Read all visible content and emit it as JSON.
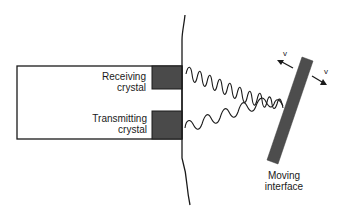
{
  "diagram": {
    "colors": {
      "background": "#ffffff",
      "line": "#1a1a1a",
      "crystal_fill": "#4a4a4a",
      "interface_fill": "#4d4d4d"
    },
    "probe": {
      "receiving_crystal": {
        "line1": "Receiving",
        "line2": "crystal"
      },
      "transmitting_crystal": {
        "line1": "Transmitting",
        "line2": "crystal"
      }
    },
    "interface": {
      "line1": "Moving",
      "line2": "interface"
    },
    "velocity_labels": {
      "toward": "v",
      "away": "v"
    },
    "elements": [
      {
        "name": "transducer-probe",
        "type": "rectangle"
      },
      {
        "name": "receiving-crystal",
        "type": "filled-rectangle"
      },
      {
        "name": "transmitting-crystal",
        "type": "filled-rectangle"
      },
      {
        "name": "skin-surface",
        "type": "curve"
      },
      {
        "name": "transmitted-wave",
        "type": "sinusoid"
      },
      {
        "name": "reflected-wave",
        "type": "sinusoid"
      },
      {
        "name": "moving-interface",
        "type": "rotated-bar"
      },
      {
        "name": "velocity-arrow-toward",
        "type": "arrow"
      },
      {
        "name": "velocity-arrow-away",
        "type": "arrow"
      }
    ]
  }
}
